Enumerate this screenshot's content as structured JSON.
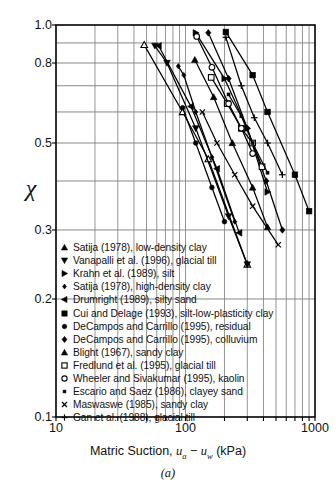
{
  "chart_data": {
    "type": "line",
    "title": "",
    "caption": "(a)",
    "xlabel_parts": {
      "pre": "Matric Suction, ",
      "ua": "u",
      "ua_sub": "a",
      "minus": " − ",
      "uw": "u",
      "uw_sub": "w",
      "unit": " (kPa)"
    },
    "xlabel_plain": "Matric Suction, ua − uw (kPa)",
    "ylabel": "χ",
    "xscale": "log",
    "yscale": "log",
    "xlim": [
      10,
      1000
    ],
    "ylim": [
      0.1,
      1.0
    ],
    "xticklabels": [
      "10",
      "100",
      "1000"
    ],
    "xtickvalues": [
      10,
      100,
      1000
    ],
    "yticklabels": [
      "1.0",
      "0.8",
      "0.5",
      "0.3",
      "0.2",
      "0.1"
    ],
    "ytickvalues": [
      1.0,
      0.8,
      0.5,
      0.3,
      0.2,
      0.1
    ],
    "gridlines_y": [
      0.9,
      0.8,
      0.7,
      0.6,
      0.5,
      0.4,
      0.3,
      0.2
    ],
    "grid": "major-log-both",
    "legend_position": "lower-left-inside",
    "series": [
      {
        "name": "Satija (1978), low-density clay",
        "marker": "triangle-up-open",
        "points": [
          [
            48,
            0.89
          ],
          [
            95,
            0.6
          ],
          [
            150,
            0.455
          ],
          [
            300,
            0.245
          ]
        ]
      },
      {
        "name": "Vanapalli et al. (1996), glacial till",
        "marker": "triangle-down",
        "points": [
          [
            58,
            0.885
          ],
          [
            72,
            0.8
          ],
          [
            120,
            0.545
          ],
          [
            215,
            0.325
          ],
          [
            300,
            0.245
          ]
        ]
      },
      {
        "name": "Krahn et al. (1989), silt",
        "marker": "triangle-right",
        "points": [
          [
            120,
            0.955
          ],
          [
            200,
            0.73
          ],
          [
            300,
            0.545
          ],
          [
            430,
            0.375
          ]
        ]
      },
      {
        "name": "Satija (1978), high-density clay",
        "marker": "diamond-small",
        "points": [
          [
            88,
            0.785
          ],
          [
            97,
            0.745
          ],
          [
            120,
            0.6
          ],
          [
            160,
            0.46
          ],
          [
            240,
            0.315
          ]
        ]
      },
      {
        "name": "Drumright (1989), silty sand",
        "marker": "triangle-left",
        "points": [
          [
            62,
            0.885
          ],
          [
            110,
            0.62
          ],
          [
            175,
            0.43
          ],
          [
            260,
            0.295
          ]
        ]
      },
      {
        "name": "Cui and Delage (1993), silt-low-plasticity clay",
        "marker": "square",
        "points": [
          [
            205,
            0.96
          ],
          [
            330,
            0.745
          ],
          [
            430,
            0.6
          ],
          [
            700,
            0.415
          ],
          [
            900,
            0.335
          ]
        ]
      },
      {
        "name": "DeCampos and Carrillo (1995), residual",
        "marker": "circle-filled",
        "points": [
          [
            95,
            0.615
          ],
          [
            120,
            0.5
          ],
          [
            160,
            0.385
          ],
          [
            200,
            0.315
          ]
        ]
      },
      {
        "name": "DeCampos and Carrillo (1995), colluvium",
        "marker": "diamond-filled",
        "points": [
          [
            150,
            0.955
          ],
          [
            215,
            0.73
          ],
          [
            300,
            0.545
          ],
          [
            420,
            0.4
          ],
          [
            560,
            0.3
          ]
        ]
      },
      {
        "name": "Blight (1967), sandy clay",
        "marker": "triangle-up",
        "points": [
          [
            118,
            0.815
          ],
          [
            165,
            0.655
          ],
          [
            230,
            0.5
          ],
          [
            330,
            0.385
          ],
          [
            430,
            0.305
          ]
        ]
      },
      {
        "name": "Fredlund et al. (1995), glacial till",
        "marker": "square-open",
        "points": [
          [
            158,
            0.735
          ],
          [
            210,
            0.63
          ],
          [
            270,
            0.545
          ],
          [
            330,
            0.5
          ],
          [
            390,
            0.435
          ]
        ]
      },
      {
        "name": "Wheeler and Sivakumar (1995), kaolin",
        "marker": "circle-open",
        "points": [
          [
            122,
            0.935
          ],
          [
            160,
            0.78
          ],
          [
            215,
            0.63
          ],
          [
            270,
            0.545
          ],
          [
            330,
            0.47
          ]
        ]
      },
      {
        "name": "Escario and Saez (1986), clayey sand",
        "marker": "square-tiny",
        "points": [
          [
            215,
            0.665
          ],
          [
            270,
            0.585
          ],
          [
            330,
            0.5
          ],
          [
            430,
            0.42
          ]
        ]
      },
      {
        "name": "Maswaswe (1985), sandy clay",
        "marker": "x",
        "points": [
          [
            135,
            0.6
          ],
          [
            175,
            0.5
          ],
          [
            240,
            0.415
          ],
          [
            330,
            0.345
          ],
          [
            520,
            0.275
          ]
        ]
      },
      {
        "name": "Gan et al. (1988), glacial till",
        "marker": "plus",
        "points": [
          [
            205,
            0.93
          ],
          [
            270,
            0.7
          ],
          [
            340,
            0.58
          ],
          [
            430,
            0.5
          ],
          [
            560,
            0.415
          ]
        ]
      }
    ]
  },
  "legend": {
    "items": [
      {
        "marker": "triangle-up",
        "label": "Satija (1978), low-density clay"
      },
      {
        "marker": "triangle-down",
        "label": "Vanapalli et al. (1996), glacial till"
      },
      {
        "marker": "triangle-right",
        "label": "Krahn et al. (1989), silt"
      },
      {
        "marker": "diamond-small",
        "label": "Satija (1978), high-density clay"
      },
      {
        "marker": "triangle-left",
        "label": "Drumright (1989), silty sand"
      },
      {
        "marker": "square",
        "label": "Cui and Delage (1993), silt-low-plasticity clay"
      },
      {
        "marker": "circle-filled",
        "label": "DeCampos and Carrillo (1995), residual"
      },
      {
        "marker": "diamond-filled",
        "label": "DeCampos and Carrillo (1995), colluvium"
      },
      {
        "marker": "triangle-up",
        "label": "Blight (1967), sandy clay"
      },
      {
        "marker": "square-open",
        "label": "Fredlund et al. (1995), glacial till"
      },
      {
        "marker": "circle-open",
        "label": "Wheeler and Sivakumar (1995), kaolin"
      },
      {
        "marker": "square-tiny",
        "label": "Escario and Saez (1986), clayey sand"
      },
      {
        "marker": "x",
        "label": "Maswaswe (1985), sandy clay"
      },
      {
        "marker": "plus",
        "label": "Gan et al. (1988), glacial till"
      }
    ]
  },
  "colors": {
    "line": "#000000",
    "grid": "#7a7a7a",
    "axis": "#000000",
    "background": "#ffffff"
  }
}
